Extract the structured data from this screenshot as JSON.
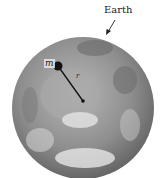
{
  "diagram": {
    "earth_label": "Earth",
    "mass_label": "m",
    "radius_label": "r"
  }
}
